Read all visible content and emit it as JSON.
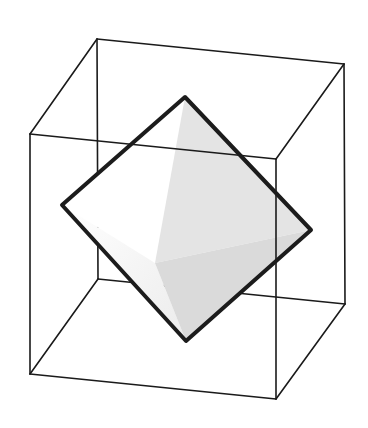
{
  "figure": {
    "width": 368,
    "height": 428,
    "background": "#ffffff"
  },
  "cube": {
    "stroke": "#1a1a1a",
    "stroke_width": 1.6,
    "vertices": {
      "back_top_left": [
        97,
        39
      ],
      "back_top_right": [
        344,
        64
      ],
      "back_bottom_left": [
        98,
        279
      ],
      "back_bottom_right": [
        345,
        304
      ],
      "front_top_left": [
        30,
        134
      ],
      "front_top_right": [
        276,
        159
      ],
      "front_bottom_left": [
        30,
        374
      ],
      "front_bottom_right": [
        276,
        399
      ]
    }
  },
  "octahedron": {
    "outline_stroke": "#1c1c1c",
    "outline_width": 4,
    "vertices": {
      "top": [
        185,
        97
      ],
      "left": [
        62,
        205
      ],
      "right": [
        311,
        230
      ],
      "bottom": [
        186,
        341
      ],
      "front": [
        155,
        263
      ]
    },
    "facets": {
      "top_left": "#ffffff",
      "top_right": "#e4e4e4",
      "bottom_left_start": "#ffffff",
      "bottom_left_end": "#ececec",
      "bottom_right": "#dadada"
    }
  }
}
